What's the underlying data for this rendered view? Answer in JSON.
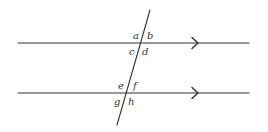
{
  "diagram": {
    "line_color": "#333333",
    "background": "#ffffff",
    "parallel_lines": [
      {
        "id": "top-line",
        "x1": 18,
        "y1": 43,
        "x2": 249,
        "y2": 43,
        "arrow_x": 196
      },
      {
        "id": "bottom-line",
        "x1": 18,
        "y1": 93,
        "x2": 249,
        "y2": 93,
        "arrow_x": 196
      }
    ],
    "transversal": {
      "x1": 150,
      "y1": 10,
      "x2": 117,
      "y2": 125
    },
    "angle_labels": {
      "a": "a",
      "b": "b",
      "c": "c",
      "d": "d",
      "e": "e",
      "f": "f",
      "g": "g",
      "h": "h"
    }
  }
}
